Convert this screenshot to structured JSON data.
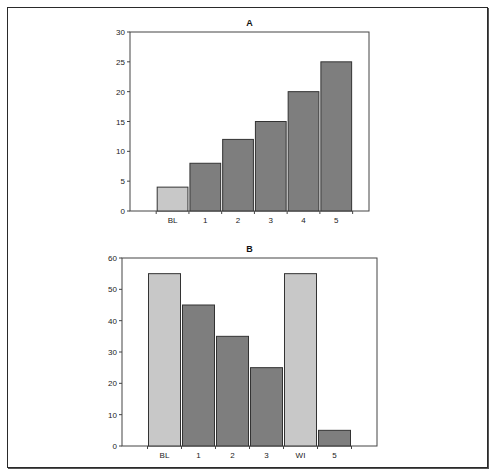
{
  "chart_data": [
    {
      "type": "bar",
      "title": "A",
      "xlabel": "",
      "ylabel": "",
      "categories": [
        "BL",
        "1",
        "2",
        "3",
        "4",
        "5"
      ],
      "values": [
        4,
        8,
        12,
        15,
        20,
        25
      ],
      "bar_colors": [
        "#c8c8c8",
        "#7e7e7e",
        "#7e7e7e",
        "#7e7e7e",
        "#7e7e7e",
        "#7e7e7e"
      ],
      "ylim": [
        0,
        30
      ],
      "yticks": [
        0,
        5,
        10,
        15,
        20,
        25,
        30
      ],
      "grid": false,
      "legend": null
    },
    {
      "type": "bar",
      "title": "B",
      "xlabel": "",
      "ylabel": "",
      "categories": [
        "BL",
        "1",
        "2",
        "3",
        "WI",
        "5"
      ],
      "values": [
        55,
        45,
        35,
        25,
        55,
        5
      ],
      "bar_colors": [
        "#c8c8c8",
        "#7e7e7e",
        "#7e7e7e",
        "#7e7e7e",
        "#c8c8c8",
        "#7e7e7e"
      ],
      "ylim": [
        0,
        60
      ],
      "yticks": [
        0,
        10,
        20,
        30,
        40,
        50,
        60
      ],
      "grid": false,
      "legend": null
    }
  ],
  "charts": {
    "a": {
      "title": "A"
    },
    "b": {
      "title": "B"
    }
  }
}
